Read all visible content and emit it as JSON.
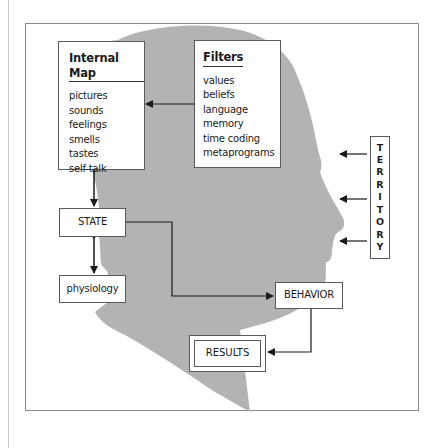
{
  "diagram": {
    "internal_map": {
      "title": "Internal Map",
      "items": [
        "pictures",
        "sounds",
        "feelings",
        "smells",
        "tastes",
        "self-talk"
      ]
    },
    "filters": {
      "title": "Filters",
      "items": [
        "values",
        "beliefs",
        "language",
        "memory",
        "time coding",
        "metaprograms"
      ]
    },
    "state": {
      "label": "STATE"
    },
    "physiology": {
      "label": "physiology"
    },
    "behavior": {
      "label": "BEHAVIOR"
    },
    "results": {
      "label": "RESULTS"
    },
    "territory": {
      "label": "TERRITORY",
      "letters": [
        "T",
        "E",
        "R",
        "R",
        "I",
        "T",
        "O",
        "R",
        "Y"
      ]
    },
    "colors": {
      "head_fill": "#b3b3b3",
      "box_border": "#5a5a5a",
      "arrow": "#1a1a1a",
      "frame": "#8a8a8a"
    }
  }
}
